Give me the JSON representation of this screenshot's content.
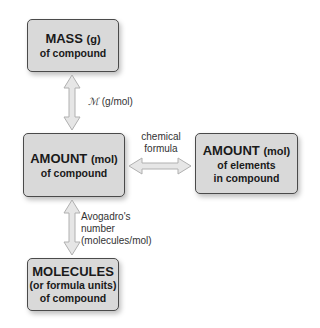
{
  "boxes": {
    "mass": {
      "title": "MASS",
      "unit": "(g)",
      "line2": "of compound"
    },
    "amount": {
      "title": "AMOUNT",
      "unit": "(mol)",
      "line2": "of compound"
    },
    "elements": {
      "title": "AMOUNT",
      "unit": "(mol)",
      "line2": "of elements",
      "line3": "in compound"
    },
    "molecules": {
      "title": "MOLECULES",
      "line2": "(or formula units)",
      "line3": "of compound"
    }
  },
  "arrows": {
    "mass_amount": {
      "symbol": "ℳ",
      "label": "(g/mol)"
    },
    "amount_elements": {
      "line1": "chemical",
      "line2": "formula"
    },
    "amount_molecules": {
      "line1": "Avogadro's",
      "line2": "number",
      "line3": "(molecules/mol)"
    }
  },
  "colors": {
    "box_fill": "#d9d9d9",
    "box_border": "#4a4a4a",
    "arrow_fill": "#e6e6e6",
    "arrow_stroke": "#b0b0b0"
  }
}
